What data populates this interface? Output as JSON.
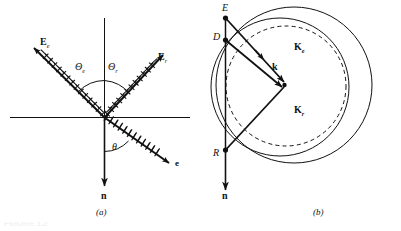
{
  "figure": {
    "background_color": "#ffffff",
    "ink_color": "#111111",
    "panels": [
      {
        "id": "a",
        "caption": "(a)",
        "description": "Reflection and transmission of a hatched ray at an interface",
        "labels": [
          {
            "name": "incident-field-label",
            "base": "E",
            "subscript": "e",
            "style": "bold"
          },
          {
            "name": "reflected-field-label",
            "base": "E",
            "subscript": "r",
            "style": "bold"
          },
          {
            "name": "incident-angle-label",
            "base": "Θ",
            "subscript": "e",
            "style": "italic"
          },
          {
            "name": "reflected-angle-label",
            "base": "Θ",
            "subscript": "r",
            "style": "italic"
          },
          {
            "name": "transmission-angle-label",
            "base": "θ",
            "subscript": "",
            "style": "italic"
          },
          {
            "name": "emergent-ray-label",
            "base": "e",
            "subscript": "",
            "style": "bold"
          },
          {
            "name": "normal-vector-label",
            "base": "n",
            "subscript": "",
            "style": "bold"
          }
        ]
      },
      {
        "id": "b",
        "caption": "(b)",
        "description": "Wave-vector construction on index surfaces: solid outer circle, dashed inner circle",
        "labels": [
          {
            "name": "point-e-label",
            "base": "E",
            "subscript": "",
            "style": "italic"
          },
          {
            "name": "point-d-label",
            "base": "D",
            "subscript": "",
            "style": "italic"
          },
          {
            "name": "point-r-label",
            "base": "R",
            "subscript": "",
            "style": "italic"
          },
          {
            "name": "extraordinary-wavevector-label",
            "base": "K",
            "subscript": "e",
            "style": "bold"
          },
          {
            "name": "wavevector-label",
            "base": "k",
            "subscript": "",
            "style": "bold"
          },
          {
            "name": "reflected-wavevector-label",
            "base": "K",
            "subscript": "r",
            "style": "bold"
          },
          {
            "name": "normal-vector-label",
            "base": "n",
            "subscript": "",
            "style": "bold"
          }
        ]
      }
    ],
    "cropped_caption_text": "FIGURE 1.2"
  },
  "panel_a": {
    "label_Ee_base": "E",
    "label_Ee_sub": "e",
    "label_Er_base": "E",
    "label_Er_sub": "r",
    "label_ThetaE_base": "Θ",
    "label_ThetaE_sub": "e",
    "label_ThetaR_base": "Θ",
    "label_ThetaR_sub": "r",
    "label_theta": "θ",
    "label_e": "e",
    "label_n": "n",
    "caption": "(a)"
  },
  "panel_b": {
    "label_E": "E",
    "label_D": "D",
    "label_R": "R",
    "label_Ke_base": "K",
    "label_Ke_sub": "e",
    "label_k": "k",
    "label_Kr_base": "K",
    "label_Kr_sub": "r",
    "label_n": "n",
    "caption": "(b)"
  },
  "bottom": {
    "cut_text": "FIGURE 1.2"
  }
}
